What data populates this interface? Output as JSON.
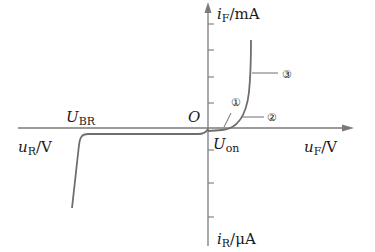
{
  "diagram": {
    "axes": {
      "y_pos": {
        "var": "i",
        "sub": "F",
        "unit": "/mA"
      },
      "y_neg": {
        "var": "i",
        "sub": "R",
        "unit": "/μA"
      },
      "x_pos": {
        "var": "u",
        "sub": "F",
        "unit": "/V"
      },
      "x_neg": {
        "var": "u",
        "sub": "R",
        "unit": "/V"
      }
    },
    "origin_label": "O",
    "breakdown_label": {
      "main": "U",
      "sub": "BR"
    },
    "on_label": {
      "main": "U",
      "sub": "on"
    },
    "regions": [
      {
        "id": "1",
        "symbol": "①"
      },
      {
        "id": "2",
        "symbol": "②"
      },
      {
        "id": "3",
        "symbol": "③"
      }
    ],
    "colors": {
      "axis": "#7a7a7a",
      "curve": "#6e6e6e",
      "text": "#1a1a1a"
    }
  }
}
